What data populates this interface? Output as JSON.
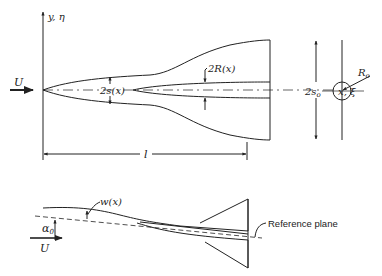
{
  "diagram": {
    "planform": {
      "axis_y_label": "y, η",
      "axis_x_label": "x, ξ",
      "freestream_label": "U",
      "semispan_label": "2s(x)",
      "body_radius_label": "2R(x)",
      "length_label": "l"
    },
    "cross_section": {
      "span_label": "2s",
      "span_subscript": "o",
      "radius_label": "R",
      "radius_subscript": "o"
    },
    "side_view": {
      "deflection_label": "w(x)",
      "angle_label": "α",
      "angle_subscript": "0",
      "freestream_label": "U",
      "reference_plane_label": "Reference plane"
    },
    "colors": {
      "ink": "#222222",
      "background": "#ffffff"
    }
  }
}
